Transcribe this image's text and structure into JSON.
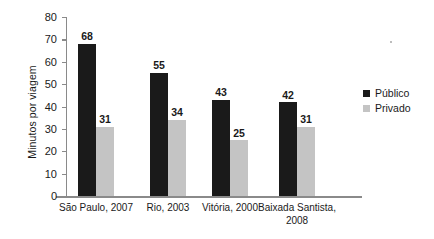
{
  "chart_data": {
    "type": "bar",
    "title": "",
    "xlabel": "",
    "ylabel": "Minutos por viagem",
    "ylim": [
      0,
      80
    ],
    "yticks": [
      0,
      10,
      20,
      30,
      40,
      50,
      60,
      70,
      80
    ],
    "ytick_labels": [
      "0",
      "10",
      "20",
      "30",
      "40",
      "50",
      "60",
      "70",
      "80"
    ],
    "grid": false,
    "legend_position": "right",
    "categories": [
      "São Paulo, 2007",
      "Rio, 2003",
      "Vitória, 2000",
      "Baixada Santista, 2008"
    ],
    "category_lines": [
      [
        "São Paulo, 2007"
      ],
      [
        "Rio, 2003"
      ],
      [
        "Vitória, 2000"
      ],
      [
        "Baixada Santista,",
        "2008"
      ]
    ],
    "series": [
      {
        "name": "Público",
        "color": "#1a1a1a",
        "values": [
          68,
          55,
          43,
          42
        ],
        "value_labels": [
          "68",
          "55",
          "43",
          "42"
        ]
      },
      {
        "name": "Privado",
        "color": "#c4c4c4",
        "values": [
          31,
          34,
          25,
          31
        ],
        "value_labels": [
          "31",
          "34",
          "25",
          "31"
        ]
      }
    ]
  },
  "legend": {
    "items": [
      {
        "label": "Público",
        "color": "#1a1a1a"
      },
      {
        "label": "Privado",
        "color": "#c4c4c4"
      }
    ]
  },
  "colors": {
    "publico": "#1a1a1a",
    "privado": "#c4c4c4",
    "axis": "#8a8a8a",
    "text": "#1a1a1a",
    "background": "#ffffff"
  }
}
